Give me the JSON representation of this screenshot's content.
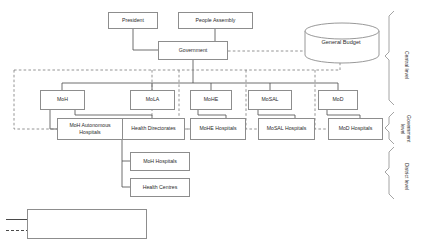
{
  "diagram": {
    "nodes": {
      "president": "President",
      "people_assembly": "People Assembly",
      "government": "Government",
      "general_budget": "General Budget",
      "moh": "MoH",
      "mola": "MoLA",
      "mohe": "MoHE",
      "mosal": "MoSAL",
      "mod": "MoD",
      "moh_autonomous_hospitals_line1": "MoH Autonomous",
      "moh_autonomous_hospitals_line2": "Hospitals",
      "health_directorates": "Health Directorates",
      "mohe_hospitals": "MoHE Hospitals",
      "mosal_hospitals": "MoSAL Hospitals",
      "mod_hospitals": "MoD Hospitals",
      "moh_hospitals": "MoH Hospitals",
      "health_centres": "Health Centres"
    },
    "levels": {
      "central": "Central level",
      "government": "Government\nlevel",
      "district": "District level"
    },
    "legend": {
      "responsibilities": "Flow of responsibilities",
      "funds": "Flow of funds"
    },
    "colors": {
      "stroke": "#8d8d8d",
      "line": "#4a4a4a",
      "dashed": "#7a7a7a",
      "text": "#2b2b2b",
      "background": "#ffffff"
    }
  }
}
